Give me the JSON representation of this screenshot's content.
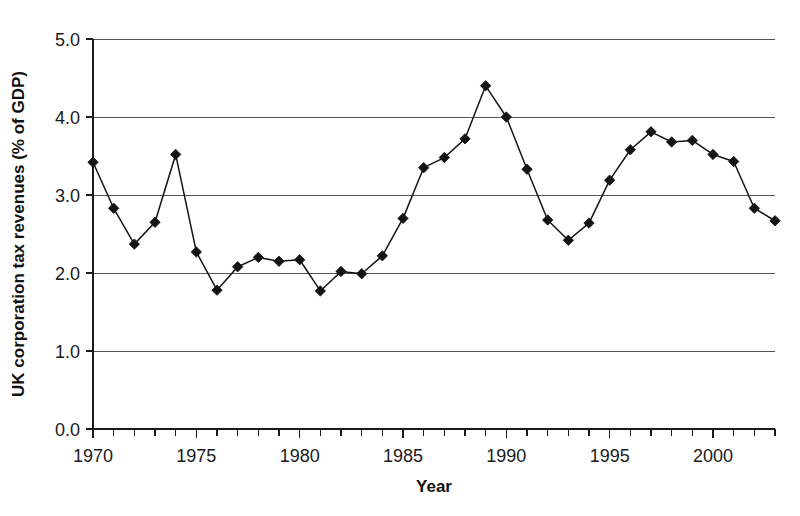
{
  "chart_data": {
    "type": "line",
    "title": "",
    "xlabel": "Year",
    "ylabel": "UK corporation tax revenues (% of GDP)",
    "xlim": [
      1970,
      2003
    ],
    "ylim": [
      0.0,
      5.0
    ],
    "grid": true,
    "grid_axis": "y",
    "legend": "none",
    "marker": "filled-diamond",
    "x": [
      1970,
      1971,
      1972,
      1973,
      1974,
      1975,
      1976,
      1977,
      1978,
      1979,
      1980,
      1981,
      1982,
      1983,
      1984,
      1985,
      1986,
      1987,
      1988,
      1989,
      1990,
      1991,
      1992,
      1993,
      1994,
      1995,
      1996,
      1997,
      1998,
      1999,
      2000,
      2001,
      2002,
      2003
    ],
    "values": [
      3.42,
      2.83,
      2.37,
      2.65,
      3.52,
      2.27,
      1.78,
      2.08,
      2.2,
      2.15,
      2.17,
      1.77,
      2.02,
      1.99,
      2.22,
      2.7,
      3.35,
      3.48,
      3.72,
      4.4,
      4.0,
      3.33,
      2.68,
      2.42,
      2.64,
      3.19,
      3.58,
      3.81,
      3.68,
      3.7,
      3.52,
      3.43,
      2.83,
      2.67
    ],
    "series": [
      {
        "name": "UK corporation tax revenues",
        "values": [
          3.42,
          2.83,
          2.37,
          2.65,
          3.52,
          2.27,
          1.78,
          2.08,
          2.2,
          2.15,
          2.17,
          1.77,
          2.02,
          1.99,
          2.22,
          2.7,
          3.35,
          3.48,
          3.72,
          4.4,
          4.0,
          3.33,
          2.68,
          2.42,
          2.64,
          3.19,
          3.58,
          3.81,
          3.68,
          3.7,
          3.52,
          3.43,
          2.83,
          2.67
        ],
        "color": "#141414"
      }
    ],
    "ytick_labels": [
      "0.0",
      "1.0",
      "2.0",
      "3.0",
      "4.0",
      "5.0"
    ],
    "ytick_values": [
      0.0,
      1.0,
      2.0,
      3.0,
      4.0,
      5.0
    ],
    "xtick_labels": [
      "1970",
      "1975",
      "1980",
      "1985",
      "1990",
      "1995",
      "2000"
    ],
    "xtick_values": [
      1970,
      1975,
      1980,
      1985,
      1990,
      1995,
      2000
    ],
    "xtick_minor_step": 1,
    "colors": {
      "line": "#141414",
      "marker": "#141414",
      "gridline": "#555555",
      "axis": "#1a1a1a",
      "background": "#ffffff",
      "text": "#1a1a1a"
    }
  }
}
